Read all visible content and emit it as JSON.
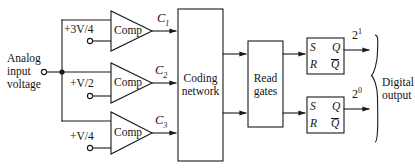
{
  "diagram": {
    "type": "block-diagram",
    "colors": {
      "stroke": "#1a1a1a",
      "background": "#ffffff",
      "text": "#131313"
    },
    "input": {
      "label_line1": "Analog",
      "label_line2": "input",
      "label_line3": "voltage"
    },
    "reference_voltages": [
      {
        "id": "vref-1",
        "label": "+3V/4"
      },
      {
        "id": "vref-2",
        "label": "+V/2"
      },
      {
        "id": "vref-3",
        "label": "+V/4"
      }
    ],
    "comparators": [
      {
        "id": "comp-1",
        "label": "Comp",
        "output_label": "C",
        "output_sub": "1"
      },
      {
        "id": "comp-2",
        "label": "Comp",
        "output_label": "C",
        "output_sub": "2"
      },
      {
        "id": "comp-3",
        "label": "Comp",
        "output_label": "C",
        "output_sub": "3"
      }
    ],
    "coding_network": {
      "line1": "Coding",
      "line2": "network"
    },
    "read_gates": {
      "line1": "Read",
      "line2": "gates"
    },
    "flipflops": [
      {
        "id": "flipflop-msb",
        "s": "S",
        "r": "R",
        "q": "Q",
        "qbar": "Q",
        "output_base": "2",
        "output_exp": "1"
      },
      {
        "id": "flipflop-lsb",
        "s": "S",
        "r": "R",
        "q": "Q",
        "qbar": "Q",
        "output_base": "2",
        "output_exp": "0"
      }
    ],
    "output": {
      "label_line1": "Digital",
      "label_line2": "output"
    }
  }
}
